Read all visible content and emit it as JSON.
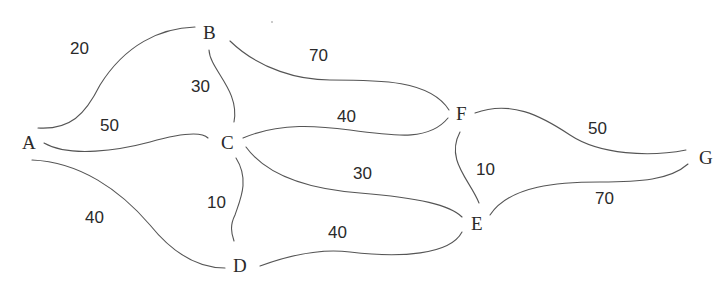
{
  "graph": {
    "nodes": [
      {
        "id": "A",
        "label": "A"
      },
      {
        "id": "B",
        "label": "B"
      },
      {
        "id": "C",
        "label": "C"
      },
      {
        "id": "D",
        "label": "D"
      },
      {
        "id": "E",
        "label": "E"
      },
      {
        "id": "F",
        "label": "F"
      },
      {
        "id": "G",
        "label": "G"
      }
    ],
    "edges": [
      {
        "from": "A",
        "to": "B",
        "weight": "20"
      },
      {
        "from": "A",
        "to": "C",
        "weight": "50"
      },
      {
        "from": "A",
        "to": "D",
        "weight": "40"
      },
      {
        "from": "B",
        "to": "C",
        "weight": "30"
      },
      {
        "from": "B",
        "to": "F",
        "weight": "70"
      },
      {
        "from": "C",
        "to": "F",
        "weight": "40"
      },
      {
        "from": "C",
        "to": "D",
        "weight": "10"
      },
      {
        "from": "C",
        "to": "E",
        "weight": "30"
      },
      {
        "from": "D",
        "to": "E",
        "weight": "40"
      },
      {
        "from": "F",
        "to": "E",
        "weight": "10"
      },
      {
        "from": "F",
        "to": "G",
        "weight": "50"
      },
      {
        "from": "E",
        "to": "G",
        "weight": "70"
      }
    ]
  }
}
